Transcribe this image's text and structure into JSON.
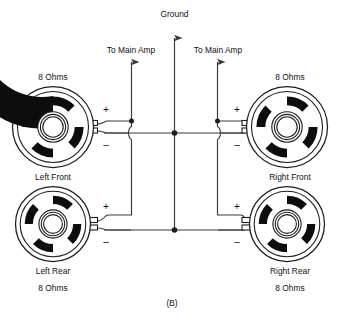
{
  "figure": {
    "caption": "(B)",
    "title_top": "Ground",
    "amp_label_left": "To Main Amp",
    "amp_label_right": "To Main Amp"
  },
  "colors": {
    "wire": "#3a3a3a",
    "outline": "#1d1d1d",
    "cone": "#0d0d0d",
    "background": "#ffffff",
    "text": "#111111"
  },
  "terminals": {
    "positive": "+",
    "negative": "–"
  },
  "speakers": [
    {
      "id": "left-front",
      "name": "Left Front",
      "impedance": "8 Ohms",
      "impedance_position": "above",
      "name_position": "below",
      "side": "left",
      "row": "front"
    },
    {
      "id": "right-front",
      "name": "Right Front",
      "impedance": "8 Ohms",
      "impedance_position": "above",
      "name_position": "below",
      "side": "right",
      "row": "front"
    },
    {
      "id": "left-rear",
      "name": "Left Rear",
      "impedance": "8 Ohms",
      "impedance_position": "below",
      "name_position": "below",
      "side": "left",
      "row": "rear"
    },
    {
      "id": "right-rear",
      "name": "Right Rear",
      "impedance": "8 Ohms",
      "impedance_position": "below",
      "name_position": "below",
      "side": "right",
      "row": "rear"
    }
  ],
  "nets": [
    {
      "id": "ground-bus",
      "label": "Ground",
      "arrow": "up"
    },
    {
      "id": "left-amp-feed",
      "label": "To Main Amp",
      "arrow": "up"
    },
    {
      "id": "right-amp-feed",
      "label": "To Main Amp",
      "arrow": "up"
    }
  ]
}
